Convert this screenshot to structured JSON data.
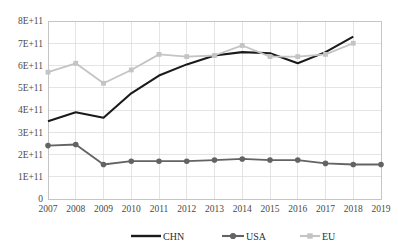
{
  "chart_data": {
    "type": "line",
    "title": "",
    "subtitle": "",
    "xlabel": "",
    "ylabel": "",
    "x": [
      2007,
      2008,
      2009,
      2010,
      2011,
      2012,
      2013,
      2014,
      2015,
      2016,
      2017,
      2018,
      2019
    ],
    "categories": [
      "2007",
      "2008",
      "2009",
      "2010",
      "2011",
      "2012",
      "2013",
      "2014",
      "2015",
      "2016",
      "2017",
      "2018",
      "2019"
    ],
    "xlim": [
      2007,
      2019
    ],
    "ylim": [
      0,
      800000000000
    ],
    "ytick_values": [
      0,
      100000000000,
      200000000000,
      300000000000,
      400000000000,
      500000000000,
      600000000000,
      700000000000,
      800000000000
    ],
    "ytick_labels": [
      "0",
      "1E+11",
      "2E+11",
      "3E+11",
      "4E+11",
      "5E+11",
      "6E+11",
      "7E+11",
      "8E+11"
    ],
    "grid": true,
    "grid_axis": "both",
    "legend_position": "bottom",
    "series": [
      {
        "name": "CHN",
        "color": "#1a1a1a",
        "marker": "none",
        "line_width": 2.1,
        "x": [
          2007,
          2008,
          2009,
          2010,
          2011,
          2012,
          2013,
          2014,
          2015,
          2016,
          2017,
          2018
        ],
        "values": [
          350000000000,
          390000000000,
          365000000000,
          475000000000,
          555000000000,
          605000000000,
          645000000000,
          660000000000,
          655000000000,
          610000000000,
          660000000000,
          730000000000
        ]
      },
      {
        "name": "USA",
        "color": "#636363",
        "marker": "circle",
        "line_width": 1.8,
        "x": [
          2007,
          2008,
          2009,
          2010,
          2011,
          2012,
          2013,
          2014,
          2015,
          2016,
          2017,
          2018,
          2019
        ],
        "values": [
          240000000000,
          245000000000,
          155000000000,
          170000000000,
          170000000000,
          170000000000,
          175000000000,
          180000000000,
          175000000000,
          175000000000,
          160000000000,
          155000000000,
          155000000000
        ]
      },
      {
        "name": "EU",
        "color": "#c4c4c4",
        "marker": "square",
        "line_width": 1.8,
        "x": [
          2007,
          2008,
          2009,
          2010,
          2011,
          2012,
          2013,
          2014,
          2015,
          2016,
          2017,
          2018
        ],
        "values": [
          570000000000,
          610000000000,
          520000000000,
          580000000000,
          650000000000,
          640000000000,
          645000000000,
          690000000000,
          640000000000,
          640000000000,
          650000000000,
          700000000000
        ]
      }
    ]
  },
  "legend": {
    "items": [
      {
        "label": "CHN"
      },
      {
        "label": "USA"
      },
      {
        "label": "EU"
      }
    ]
  }
}
